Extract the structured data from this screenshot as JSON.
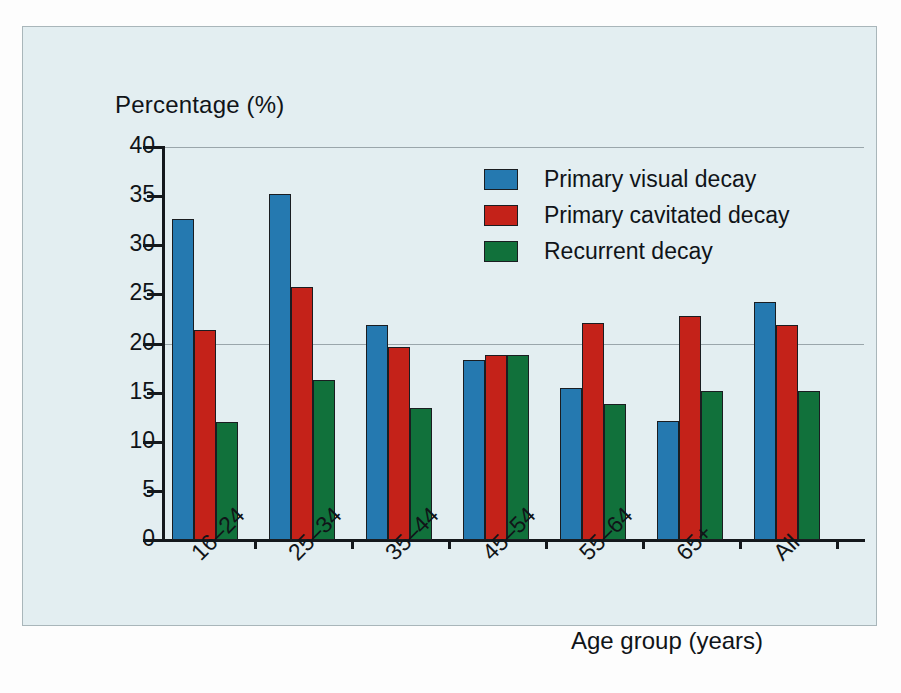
{
  "chart_data": {
    "type": "bar",
    "title": "",
    "xlabel": "Age group (years)",
    "ylabel": "Percentage (%)",
    "ylim": [
      0,
      40
    ],
    "yticks": [
      0,
      5,
      10,
      15,
      20,
      25,
      30,
      35,
      40
    ],
    "grid": "horizontal gridlines at 20 and 40",
    "legend_position": "top-center-right inside plot",
    "categories": [
      "16–24",
      "25–34",
      "35–44",
      "45–54",
      "55–64",
      "65+",
      "All"
    ],
    "series": [
      {
        "name": "Primary visual decay",
        "color": "#2579b0",
        "values": [
          32.7,
          35.2,
          21.9,
          18.3,
          15.5,
          12.1,
          24.2
        ]
      },
      {
        "name": "Primary cavitated decay",
        "color": "#c42219",
        "values": [
          21.4,
          25.8,
          19.6,
          18.8,
          22.1,
          22.8,
          21.9
        ]
      },
      {
        "name": "Recurrent decay",
        "color": "#11713b",
        "values": [
          12.0,
          16.3,
          13.4,
          18.8,
          13.8,
          15.2,
          15.2
        ]
      }
    ]
  },
  "axes": {
    "y_title": "Percentage (%)",
    "x_title": "Age group (years)"
  },
  "colors": {
    "background": "#e3eef1",
    "border": "#a9b6ba",
    "axis": "#14181c",
    "grid": "#9aa6ab",
    "series_blue": "#2579b0",
    "series_red": "#c42219",
    "series_green": "#11713b"
  }
}
